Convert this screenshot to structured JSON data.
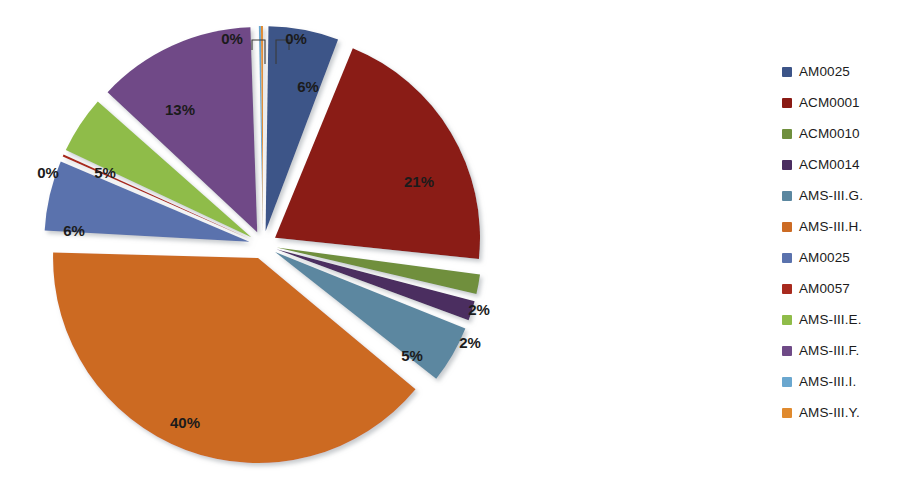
{
  "chart_data": {
    "type": "pie",
    "title": "",
    "exploded": true,
    "legend_position": "right",
    "grid": false,
    "labels_suffix": "%",
    "categories": [
      "AM0025",
      "ACM0001",
      "ACM0010",
      "ACM0014",
      "AMS-III.G.",
      "AMS-III.H.",
      "AM0025",
      "AM0057",
      "AMS-III.E.",
      "AMS-III.F.",
      "AMS-III.I.",
      "AMS-III.Y."
    ],
    "values": [
      6,
      21,
      2,
      2,
      5,
      40,
      6,
      0,
      5,
      13,
      0,
      0
    ],
    "display_labels": [
      "6%",
      "21%",
      "2%",
      "2%",
      "5%",
      "40%",
      "6%",
      "0%",
      "5%",
      "13%",
      "0%",
      "0%"
    ],
    "colors": [
      "#3c5488",
      "#8a1a14",
      "#6f8f3d",
      "#4b2d60",
      "#5b87a0",
      "#cc6b24",
      "#5a72ad",
      "#a82a1e",
      "#8fbc49",
      "#6f4a87",
      "#6aa7cf",
      "#e08a2e"
    ],
    "slices": [
      {
        "category": "AM0025",
        "value": 6,
        "label": "6%",
        "color": "#3c5488"
      },
      {
        "category": "ACM0001",
        "value": 21,
        "label": "21%",
        "color": "#8a1a14"
      },
      {
        "category": "ACM0010",
        "value": 2,
        "label": "2%",
        "color": "#6f8f3d"
      },
      {
        "category": "ACM0014",
        "value": 2,
        "label": "2%",
        "color": "#4b2d60"
      },
      {
        "category": "AMS-III.G.",
        "value": 5,
        "label": "5%",
        "color": "#5b87a0"
      },
      {
        "category": "AMS-III.H.",
        "value": 40,
        "label": "40%",
        "color": "#cc6b24"
      },
      {
        "category": "AM0025",
        "value": 6,
        "label": "6%",
        "color": "#5a72ad"
      },
      {
        "category": "AM0057",
        "value": 0,
        "label": "0%",
        "color": "#a82a1e"
      },
      {
        "category": "AMS-III.E.",
        "value": 5,
        "label": "5%",
        "color": "#8fbc49"
      },
      {
        "category": "AMS-III.F.",
        "value": 13,
        "label": "13%",
        "color": "#6f4a87"
      },
      {
        "category": "AMS-III.I.",
        "value": 0,
        "label": "0%",
        "color": "#6aa7cf"
      },
      {
        "category": "AMS-III.Y.",
        "value": 0,
        "label": "0%",
        "color": "#e08a2e"
      }
    ]
  },
  "labels": {
    "l0": "6%",
    "l1": "21%",
    "l2": "2%",
    "l3": "2%",
    "l4": "5%",
    "l5": "40%",
    "l6": "6%",
    "l7": "0%",
    "l8": "5%",
    "l9": "13%",
    "l10": "0%",
    "l11": "0%"
  },
  "legend": {
    "items": [
      {
        "label": "AM0025",
        "color": "#3c5488"
      },
      {
        "label": "ACM0001",
        "color": "#8a1a14"
      },
      {
        "label": "ACM0010",
        "color": "#6f8f3d"
      },
      {
        "label": "ACM0014",
        "color": "#4b2d60"
      },
      {
        "label": "AMS-III.G.",
        "color": "#5b87a0"
      },
      {
        "label": "AMS-III.H.",
        "color": "#cc6b24"
      },
      {
        "label": "AM0025",
        "color": "#5a72ad"
      },
      {
        "label": "AM0057",
        "color": "#a82a1e"
      },
      {
        "label": "AMS-III.E.",
        "color": "#8fbc49"
      },
      {
        "label": "AMS-III.F.",
        "color": "#6f4a87"
      },
      {
        "label": "AMS-III.I.",
        "color": "#6aa7cf"
      },
      {
        "label": "AMS-III.Y.",
        "color": "#e08a2e"
      }
    ]
  }
}
